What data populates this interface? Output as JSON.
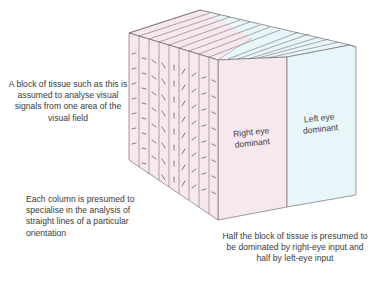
{
  "diagram": {
    "colors": {
      "right_eye_fill": "#f7e8ee",
      "left_eye_fill": "#e6f6f9",
      "edge_stroke": "#7a6f76"
    },
    "faces": {
      "right_eye_label_line1": "Right eye",
      "right_eye_label_line2": "dominant",
      "left_eye_label_line1": "Left eye",
      "left_eye_label_line2": "dominant"
    },
    "columns": {
      "count": 9,
      "orientations_deg": [
        0,
        10,
        45,
        60,
        90,
        120,
        150,
        10,
        30
      ]
    },
    "captions": {
      "block": "A block of tissue such as this is assumed to analyse visual signals from one area of the visual field",
      "columns": "Each column is presumed to specialise in the analysis of straight lines of a particular orientation",
      "halves": "Half the block of tissue is presumed to be dominated by right-eye input and half by left-eye input"
    }
  }
}
